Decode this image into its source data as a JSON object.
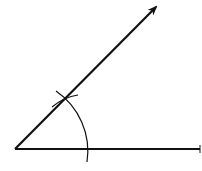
{
  "diagram": {
    "type": "geometric-construction",
    "colors": {
      "stroke": "#111111",
      "background": "#ffffff"
    },
    "vertex": {
      "x": 15,
      "y": 149
    },
    "rays": [
      {
        "id": "base-ray",
        "from": [
          15,
          149
        ],
        "to": [
          200,
          149
        ],
        "arrow": true
      },
      {
        "id": "angled-ray",
        "from": [
          15,
          149
        ],
        "to": [
          157,
          6
        ],
        "arrow": true
      }
    ],
    "arcs": [
      {
        "id": "main-arc",
        "description": "Arc centered at vertex crossing both rays"
      },
      {
        "id": "intersection-arc",
        "description": "Small arc crossing the angled ray"
      }
    ]
  }
}
